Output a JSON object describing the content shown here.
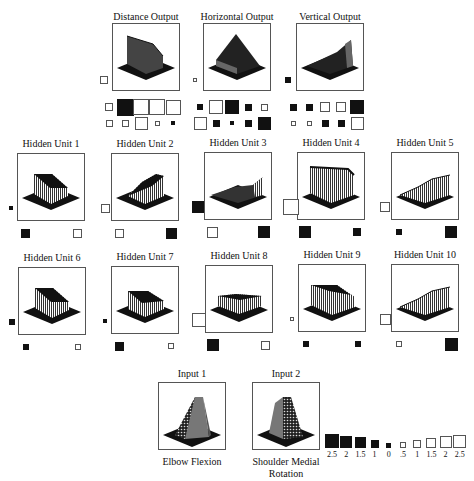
{
  "colors": {
    "negative": "#111111",
    "positive": "#ffffff",
    "frame": "#555555"
  },
  "outputs": [
    {
      "id": "distance",
      "title": "Distance Output",
      "x": 112,
      "y": 23,
      "bias": {
        "sign": "pos",
        "size": 8
      },
      "row1": [
        {
          "sign": "pos",
          "size": 8
        },
        {
          "sign": "neg",
          "size": 17
        },
        {
          "sign": "pos",
          "size": 16
        },
        {
          "sign": "pos",
          "size": 16
        },
        {
          "sign": "pos",
          "size": 15
        }
      ],
      "row2": [
        {
          "sign": "pos",
          "size": 7
        },
        {
          "sign": "pos",
          "size": 7
        },
        {
          "sign": "pos",
          "size": 13
        },
        {
          "sign": "pos",
          "size": 5
        },
        {
          "sign": "neg",
          "size": 4
        }
      ]
    },
    {
      "id": "horizontal",
      "title": "Horizontal Output",
      "x": 203,
      "y": 23,
      "bias": {
        "sign": "pos",
        "size": 4
      },
      "row1": [
        {
          "sign": "neg",
          "size": 6
        },
        {
          "sign": "pos",
          "size": 14
        },
        {
          "sign": "neg",
          "size": 14
        },
        {
          "sign": "neg",
          "size": 7
        },
        {
          "sign": "pos",
          "size": 7
        }
      ],
      "row2": [
        {
          "sign": "pos",
          "size": 13
        },
        {
          "sign": "neg",
          "size": 7
        },
        {
          "sign": "neg",
          "size": 4
        },
        {
          "sign": "neg",
          "size": 7
        },
        {
          "sign": "neg",
          "size": 13
        }
      ]
    },
    {
      "id": "vertical",
      "title": "Vertical Output",
      "x": 296,
      "y": 23,
      "bias": {
        "sign": "neg",
        "size": 6
      },
      "row1": [
        {
          "sign": "neg",
          "size": 7
        },
        {
          "sign": "neg",
          "size": 7
        },
        {
          "sign": "pos",
          "size": 10
        },
        {
          "sign": "pos",
          "size": 10
        },
        {
          "sign": "neg",
          "size": 14
        }
      ],
      "row2": [
        {
          "sign": "pos",
          "size": 5
        },
        {
          "sign": "pos",
          "size": 5
        },
        {
          "sign": "neg",
          "size": 7
        },
        {
          "sign": "neg",
          "size": 7
        },
        {
          "sign": "pos",
          "size": 13
        }
      ]
    }
  ],
  "hidden_units": [
    {
      "title": "Hidden Unit 1",
      "x": 17,
      "y": 153,
      "bias": {
        "sign": "neg",
        "size": 4
      },
      "w1": {
        "sign": "neg",
        "size": 9
      },
      "w2": {
        "sign": "pos",
        "size": 9
      },
      "shape": "ramp-left"
    },
    {
      "title": "Hidden Unit 2",
      "x": 111,
      "y": 153,
      "bias": {
        "sign": "pos",
        "size": 9
      },
      "w1": {
        "sign": "pos",
        "size": 9
      },
      "w2": {
        "sign": "neg",
        "size": 11
      },
      "shape": "ramp-right"
    },
    {
      "title": "Hidden Unit 3",
      "x": 204,
      "y": 152,
      "bias": {
        "sign": "neg",
        "size": 12
      },
      "w1": {
        "sign": "pos",
        "size": 11
      },
      "w2": {
        "sign": "neg",
        "size": 12
      },
      "shape": "dip"
    },
    {
      "title": "Hidden Unit 4",
      "x": 297,
      "y": 152,
      "bias": {
        "sign": "pos",
        "size": 16
      },
      "w1": {
        "sign": "neg",
        "size": 12
      },
      "w2": {
        "sign": "neg",
        "size": 8
      },
      "shape": "wall"
    },
    {
      "title": "Hidden Unit 5",
      "x": 391,
      "y": 152,
      "bias": {
        "sign": "pos",
        "size": 10
      },
      "w1": {
        "sign": "neg",
        "size": 6
      },
      "w2": {
        "sign": "neg",
        "size": 12
      },
      "shape": "rise-right"
    },
    {
      "title": "Hidden Unit 6",
      "x": 18,
      "y": 267,
      "bias": {
        "sign": "neg",
        "size": 6
      },
      "w1": {
        "sign": "neg",
        "size": 6
      },
      "w2": {
        "sign": "pos",
        "size": 6
      },
      "shape": "ramp-left"
    },
    {
      "title": "Hidden Unit 7",
      "x": 111,
      "y": 266,
      "bias": {
        "sign": "neg",
        "size": 4
      },
      "w1": {
        "sign": "neg",
        "size": 9
      },
      "w2": {
        "sign": "pos",
        "size": 6
      },
      "shape": "ramp-left-low"
    },
    {
      "title": "Hidden Unit 8",
      "x": 205,
      "y": 265,
      "bias": {
        "sign": "pos",
        "size": 14
      },
      "w1": {
        "sign": "neg",
        "size": 12
      },
      "w2": {
        "sign": "pos",
        "size": 9
      },
      "shape": "plateau-low"
    },
    {
      "title": "Hidden Unit 9",
      "x": 298,
      "y": 264,
      "bias": {
        "sign": "pos",
        "size": 4
      },
      "w1": {
        "sign": "neg",
        "size": 6
      },
      "w2": {
        "sign": "neg",
        "size": 6
      },
      "shape": "wall-slope"
    },
    {
      "title": "Hidden Unit 10",
      "x": 391,
      "y": 264,
      "bias": {
        "sign": "pos",
        "size": 11
      },
      "w1": {
        "sign": "pos",
        "size": 6
      },
      "w2": {
        "sign": "neg",
        "size": 13
      },
      "shape": "rise-right"
    }
  ],
  "inputs": [
    {
      "title": "Input 1",
      "x": 158,
      "y": 382,
      "caption": [
        "Elbow Flexion"
      ],
      "shape": "prism-left"
    },
    {
      "title": "Input 2",
      "x": 252,
      "y": 382,
      "caption": [
        "Shoulder Medial",
        "Rotation"
      ],
      "shape": "prism-right"
    }
  ],
  "legend": {
    "items": [
      {
        "label": "2.5",
        "sign": "neg",
        "size": 14
      },
      {
        "label": "2",
        "sign": "neg",
        "size": 12
      },
      {
        "label": "1.5",
        "sign": "neg",
        "size": 11
      },
      {
        "label": "1",
        "sign": "neg",
        "size": 8
      },
      {
        "label": "0",
        "sign": "neg",
        "size": 5
      },
      {
        "label": ".5",
        "sign": "pos",
        "size": 6
      },
      {
        "label": "1",
        "sign": "pos",
        "size": 8
      },
      {
        "label": "1.5",
        "sign": "pos",
        "size": 10
      },
      {
        "label": "2",
        "sign": "pos",
        "size": 12
      },
      {
        "label": "2.5",
        "sign": "pos",
        "size": 13
      }
    ]
  }
}
